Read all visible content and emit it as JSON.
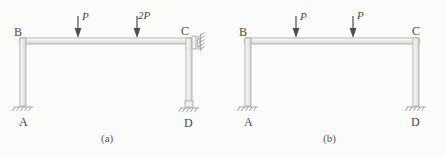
{
  "figure": {
    "background_color": "#fbfbfa",
    "line_color": "#8d8d8d",
    "member_fill": "#e9e9e7",
    "text_color": "#4a4a4a"
  },
  "frames": [
    {
      "id": "a",
      "caption": "(a)",
      "nodes": [
        {
          "name": "B",
          "label": "B",
          "position": "top-left"
        },
        {
          "name": "C",
          "label": "C",
          "position": "top-right"
        },
        {
          "name": "A",
          "label": "A",
          "position": "bottom-left"
        },
        {
          "name": "D",
          "label": "D",
          "position": "bottom-right"
        }
      ],
      "loads": [
        {
          "name": "load-p",
          "label": "P",
          "direction": "down"
        },
        {
          "name": "load-2p",
          "label": "2P",
          "direction": "down"
        }
      ],
      "supports": [
        {
          "at": "A",
          "type": "fixed-ground"
        },
        {
          "at": "C",
          "type": "roller-vertical-wall"
        },
        {
          "at": "D",
          "type": "fixed-ground"
        }
      ]
    },
    {
      "id": "b",
      "caption": "(b)",
      "nodes": [
        {
          "name": "B",
          "label": "B",
          "position": "top-left"
        },
        {
          "name": "C",
          "label": "C",
          "position": "top-right"
        },
        {
          "name": "A",
          "label": "A",
          "position": "bottom-left"
        },
        {
          "name": "D",
          "label": "D",
          "position": "bottom-right"
        }
      ],
      "loads": [
        {
          "name": "load-p-left",
          "label": "P",
          "direction": "down"
        },
        {
          "name": "load-p-right",
          "label": "P",
          "direction": "down"
        }
      ],
      "supports": [
        {
          "at": "A",
          "type": "fixed-ground"
        },
        {
          "at": "D",
          "type": "fixed-ground"
        }
      ]
    }
  ]
}
